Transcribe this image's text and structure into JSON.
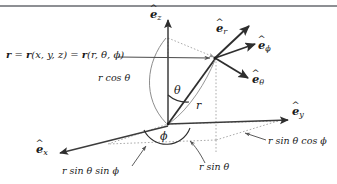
{
  "figure": {
    "type": "spherical-coordinates-diagram",
    "colors": {
      "rule": "#8d8f93",
      "axis": "#3c3c3c",
      "dotted": "#9b9b9b",
      "arc": "#7a7a7a",
      "text": "#1a1a1a",
      "background": "#ffffff"
    }
  },
  "axes": {
    "z": {
      "hat": "^",
      "base": "e",
      "sub": "z"
    },
    "y": {
      "hat": "^",
      "base": "e",
      "sub": "y"
    },
    "x": {
      "hat": "^",
      "base": "e",
      "sub": "x"
    }
  },
  "basis_vectors": {
    "r": {
      "hat": "^",
      "base": "e",
      "sub": "r"
    },
    "phi": {
      "hat": "^",
      "base": "e",
      "sub": "ϕ"
    },
    "theta": {
      "hat": "^",
      "base": "e",
      "sub": "θ"
    }
  },
  "position_label": {
    "lhs": "r",
    "eq1": " = ",
    "fn1": "r",
    "args1": "(x, y, z)",
    "eq2": " = ",
    "fn2": "r",
    "args2": "(r, θ, ϕ)",
    "full": "r = r(x, y, z) = r(r, θ, ϕ)"
  },
  "annotations": {
    "r_cos_theta": "r cos θ",
    "theta": "θ",
    "r": "r",
    "phi": "ϕ",
    "r_sin_theta_sin_phi": "r sin θ sin ϕ",
    "r_sin_theta": "r sin θ",
    "r_sin_theta_cos_phi": "r sin θ cos ϕ"
  }
}
